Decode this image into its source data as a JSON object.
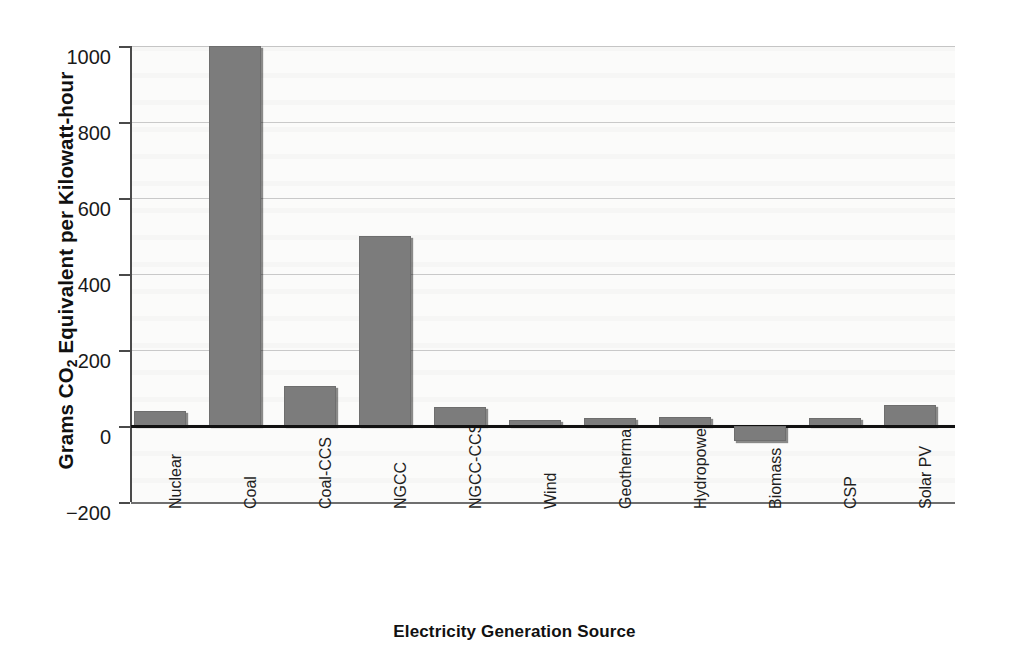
{
  "chart_data": {
    "type": "bar",
    "title": "",
    "xlabel": "Electricity Generation Source",
    "ylabel": "Grams CO2 Equivalent per Kilowatt-hour",
    "ylabel_parts": {
      "prefix": "Grams CO",
      "sub": "2",
      "suffix": " Equivalent per Kilowatt-hour"
    },
    "categories": [
      "Nuclear",
      "Coal",
      "Coal-CCS",
      "NGCC",
      "NGCC-CCS",
      "Wind",
      "Geothermal",
      "Hydropower",
      "Biomass",
      "CSP",
      "Solar PV"
    ],
    "values": [
      40,
      1000,
      105,
      500,
      50,
      15,
      20,
      25,
      -40,
      20,
      55
    ],
    "ylim": [
      -200,
      1000
    ],
    "yticks": [
      1000,
      800,
      600,
      400,
      200,
      0,
      -200
    ],
    "ytick_labels": [
      "1000",
      "800",
      "600",
      "400",
      "200",
      "0",
      "−200"
    ],
    "grid": true,
    "grid_axis": "y",
    "legend": "none",
    "bar_color": "#7c7c7c",
    "bar_edge_color": "#6e6e6e",
    "plot_background": "#fbfbfa",
    "zero_line_color": "#111111",
    "axis_color": "#4a4a4a",
    "gridline_color": "#c9c9c9"
  }
}
